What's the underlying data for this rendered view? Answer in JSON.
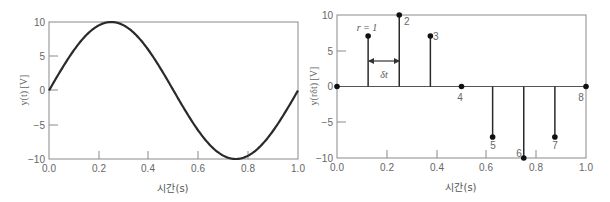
{
  "chart_data": [
    {
      "type": "line",
      "title": "",
      "xlabel": "시간(s)",
      "ylabel": "y(t) [V]",
      "xlim": [
        0.0,
        1.0
      ],
      "ylim": [
        -10,
        10
      ],
      "xticks": [
        "0.0",
        "0.2",
        "0.4",
        "0.6",
        "0.8",
        "1.0"
      ],
      "yticks": [
        "10",
        "5",
        "0",
        "-5",
        "-10"
      ],
      "grid": false,
      "series": [
        {
          "name": "y(t) = 10 sin(2πt)",
          "function": "10*sin(2*pi*t)",
          "amplitude": 10,
          "frequency_hz": 1,
          "x": [
            0,
            0.125,
            0.25,
            0.375,
            0.5,
            0.625,
            0.75,
            0.875,
            1.0
          ],
          "values": [
            0,
            7.07,
            10,
            7.07,
            0,
            -7.07,
            -10,
            -7.07,
            0
          ]
        }
      ]
    },
    {
      "type": "stem",
      "title": "",
      "xlabel": "시간(s)",
      "ylabel": "y(rδt) [V]",
      "xlim": [
        0.0,
        1.0
      ],
      "ylim": [
        -10,
        10
      ],
      "xticks": [
        "0.0",
        "0.2",
        "0.4",
        "0.6",
        "0.8",
        "1.0"
      ],
      "yticks": [
        "10",
        "5",
        "0",
        "-5",
        "-10"
      ],
      "grid": false,
      "series": [
        {
          "name": "samples",
          "x": [
            0,
            0.125,
            0.25,
            0.375,
            0.5,
            0.625,
            0.75,
            0.875,
            1.0
          ],
          "values": [
            0,
            7.07,
            10,
            7.07,
            0,
            -7.07,
            -10,
            -7.07,
            0
          ],
          "labels": [
            "",
            "r = 1",
            "2",
            "3",
            "4",
            "5",
            "6",
            "7",
            "8"
          ]
        }
      ],
      "annotations": [
        {
          "text": "δt",
          "type": "interval-arrow",
          "from_x": 0.125,
          "to_x": 0.25,
          "y": 3.5
        }
      ]
    }
  ],
  "left": {
    "ylabel": "y(t) [V]",
    "xlabel": "시간(s)",
    "xticks": [
      "0.0",
      "0.2",
      "0.4",
      "0.6",
      "0.8",
      "1.0"
    ],
    "yticks": [
      "10",
      "5",
      "0",
      "−5",
      "−10"
    ]
  },
  "right": {
    "ylabel": "y(rδt) [V]",
    "xlabel": "시간(s)",
    "xticks": [
      "0.0",
      "0.2",
      "0.4",
      "0.6",
      "0.8",
      "1.0"
    ],
    "yticks": [
      "10",
      "5",
      "0",
      "−5",
      "−10"
    ],
    "sample_labels": [
      "r = 1",
      "2",
      "3",
      "4",
      "5",
      "6",
      "7",
      "8"
    ],
    "delta_label": "δt"
  },
  "colors": {
    "line": "#2a2a2a",
    "frame": "#888888",
    "text": "#666666"
  }
}
